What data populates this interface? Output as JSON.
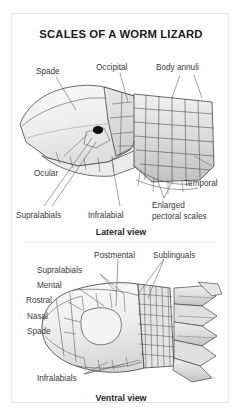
{
  "figure": {
    "title": "SCALES OF A WORM LIZARD",
    "background": "#ffffff",
    "border_color": "#e6e6e6",
    "text_color": "#3a3a3a",
    "title_color": "#1b1b1b"
  },
  "panels": [
    {
      "id": "lateral",
      "caption": "Lateral view",
      "labels": [
        {
          "key": "spade",
          "text": "Spade"
        },
        {
          "key": "occipital",
          "text": "Occipital"
        },
        {
          "key": "annuli",
          "text": "Body annuli"
        },
        {
          "key": "ocular",
          "text": "Ocular"
        },
        {
          "key": "temporal",
          "text": "Temporal"
        },
        {
          "key": "supralabials",
          "text": "Supralabials"
        },
        {
          "key": "infralabial",
          "text": "Infralabial"
        },
        {
          "key": "pectoral1",
          "text": "Enlarged"
        },
        {
          "key": "pectoral2",
          "text": "pectoral scales"
        }
      ]
    },
    {
      "id": "ventral",
      "caption": "Ventral view",
      "labels": [
        {
          "key": "postmental",
          "text": "Postmental"
        },
        {
          "key": "sublinguals",
          "text": "Sublinguals"
        },
        {
          "key": "supralabials",
          "text": "Supralabials"
        },
        {
          "key": "mental",
          "text": "Mental"
        },
        {
          "key": "rostral",
          "text": "Rostral"
        },
        {
          "key": "nasal",
          "text": "Nasal"
        },
        {
          "key": "spade",
          "text": "Spade"
        },
        {
          "key": "infralabials",
          "text": "Infralabials"
        }
      ]
    }
  ],
  "artwork": {
    "line_color": "#4a4a4a",
    "scale_fill_light": "#f2f2f2",
    "scale_fill_mid": "#dcdcdc",
    "scale_fill_dark": "#c4c4c4",
    "eye_color": "#111111",
    "leader_color": "#6e6e6e"
  }
}
